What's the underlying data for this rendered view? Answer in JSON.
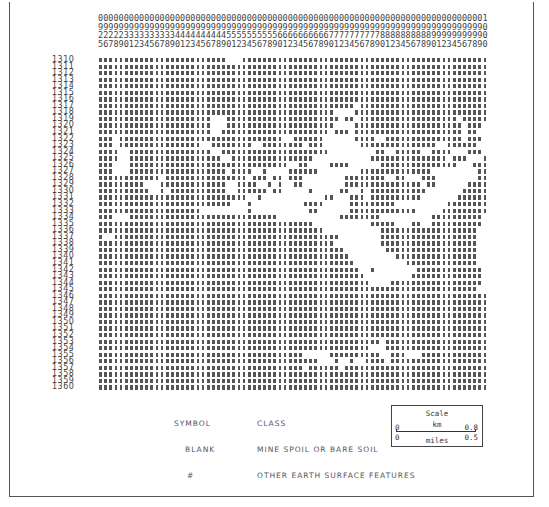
{
  "map": {
    "column_header_rows": [
      "0000000000000000000000000000000000000000000000000000000000000000000000000001",
      "9999999999999999999999999999999999999999999999999999999999999999999999999990",
      "2222233333333334444444444555555555566666666667777777777888888888899999999990",
      "5678901234567890123456789012345678901234567890123456789012345678901234567890"
    ],
    "columns": {
      "start": 925,
      "end": 1000
    },
    "row_labels": [
      "1310",
      "1311",
      "1312",
      "1313",
      "1314",
      "1315",
      "1316",
      "1317",
      "1318",
      "1319",
      "1320",
      "1321",
      "1322",
      "1323",
      "1324",
      "1325",
      "1326",
      "1327",
      "1328",
      "1329",
      "1330",
      "1331",
      "1332",
      "1333",
      "1334",
      "1335",
      "1336",
      "1337",
      "1338",
      "1339",
      "1340",
      "1341",
      "1342",
      "1343",
      "1344",
      "1345",
      "1346",
      "1347",
      "1348",
      "1349",
      "1350",
      "1351",
      "1352",
      "1353",
      "1354",
      "1355",
      "1356",
      "1357",
      "1358",
      "1359",
      "1360"
    ],
    "symbol_filled": "#",
    "rows": [
      "#########################   ################################################",
      "############################################################################",
      "############################################################################",
      "############################################################################",
      "############################################################################",
      "############################################################################",
      "############################################################################",
      "################################################## #########################",
      "##############################################    ##########################",
      "######################   ###################### ## ################### #####",
      "######################   #####################    ##################### ###",
      "######################  ##################### ### ##################### ##  ",
      "### ################################  ######      ####  ############### ### ",
      "### ################  ########  ######## ###       ###############  ######  ",
      "####  ################  #####################         ##  #####  ####   ### #",
      "####  ##################  ################           ############### ###   ##",
      "###   ###############################  ##    ####      ###############   ###",
      "###   ################### ####  #    ######        ##############         ##",
      "############ ################ ### ## ###        ########  ##   ###        ##",
      "#########   #############  ####  # #  ##        ############### ##      ####",
      "##########  # ###########  ###### ##     #     ##  # ###########       #####",
      "#############################  #            ##   ### ##########       ######",
      "##########################   #          ####     #########          ########",
      "####################         #           ##      #############     #########",
      "###   #############################            ########          ##########",
      "##########################################           #####   ##  ##########",
      "############################################           ###################",
      "#  ############################################        ###################",
      "##############################################         ###################",
      "################################################        ##################",
      "#################################################         ################",
      "##################################################          ##############",
      "###################################################  #        #############",
      "####################################################         ##############",
      "#####################################################    ##################",
      "##########################################################################  ",
      "############################################################################",
      "############################################################################",
      "############################################################################",
      "############################################################################",
      "############################################################################",
      "############################################################################",
      "############################################################################",
      "####################################################### ####################",
      "#####################################################   ####################",
      "########################################     ##########  ###   #############",
      "###########################################   #  #  #### ####################",
      "######################################## ###### ############################",
      "############################################################################",
      "############################################################################",
      "############################################################################"
    ]
  },
  "legend": {
    "symbol_header": "SYMBOL",
    "class_header": "CLASS",
    "entries": [
      {
        "symbol": "BLANK",
        "class": "MINE SPOIL OR BARE SOIL"
      },
      {
        "symbol": "#",
        "class": "OTHER EARTH SURFACE FEATURES"
      }
    ]
  },
  "scale": {
    "title": "Scale",
    "km_label": "km",
    "km_start": "0",
    "km_end": "0.8",
    "miles_label": "miles",
    "miles_start": "0",
    "miles_end": "0.5"
  }
}
